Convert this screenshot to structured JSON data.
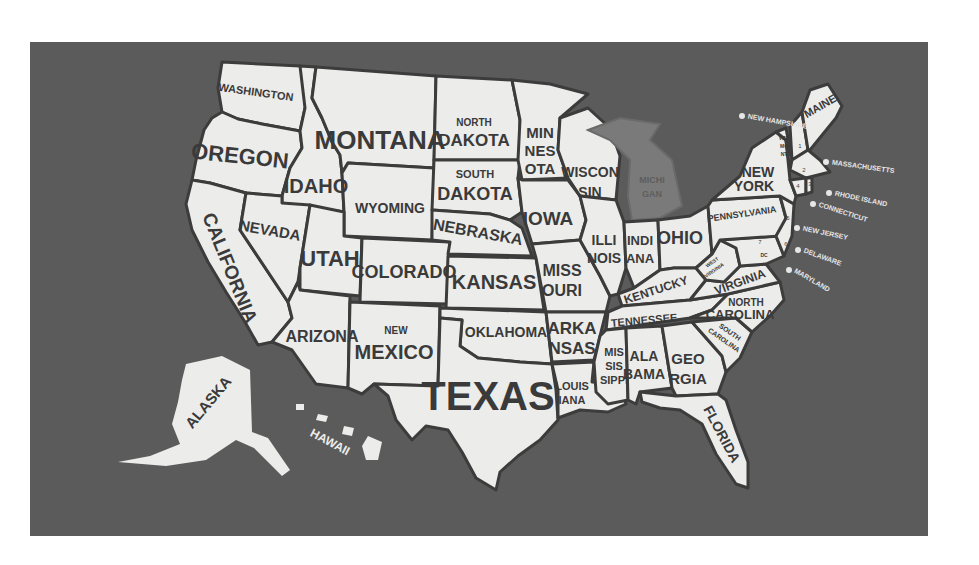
{
  "map": {
    "title": "United States Map with State Names",
    "colors": {
      "background": "#ffffff",
      "board": "#5b5b5b",
      "state_fill": "#ececea",
      "state_border": "#3c3c3c",
      "label_text": "#3a3a3a",
      "michigan_fill": "#7a7a7a",
      "callout_text": "#e6e6e6"
    },
    "states": {
      "washington": "WASHINGTON",
      "oregon": "OREGON",
      "california": "CALIFORNIA",
      "idaho": "IDAHO",
      "nevada": "NEVADA",
      "montana": "MONTANA",
      "wyoming": "WYOMING",
      "utah": "UTAH",
      "arizona": "ARIZONA",
      "colorado": "COLORADO",
      "new_mexico_top": "NEW",
      "new_mexico_bottom": "MEXICO",
      "north_dakota_top": "NORTH",
      "north_dakota_bottom": "DAKOTA",
      "south_dakota_top": "SOUTH",
      "south_dakota_bottom": "DAKOTA",
      "nebraska": "NEBRASKA",
      "kansas": "KANSAS",
      "oklahoma": "OKLAHOMA",
      "texas": "TEXAS",
      "minnesota_1": "MIN",
      "minnesota_2": "NES",
      "minnesota_3": "OTA",
      "iowa": "IOWA",
      "missouri_1": "MISS",
      "missouri_2": "OURI",
      "arkansas_1": "ARKA",
      "arkansas_2": "NSAS",
      "louisiana_1": "LOUIS",
      "louisiana_2": "IANA",
      "wisconsin_1": "WISCON",
      "wisconsin_2": "SIN",
      "illinois_1": "ILLI",
      "illinois_2": "NOIS",
      "michigan_1": "MICHI",
      "michigan_2": "GAN",
      "indiana_1": "INDI",
      "indiana_2": "ANA",
      "ohio": "OHIO",
      "kentucky": "KENTUCKY",
      "tennessee": "TENNESSEE",
      "mississippi_1": "MIS",
      "mississippi_2": "SIS",
      "mississippi_3": "SIPPI",
      "alabama_1": "ALA",
      "alabama_2": "BAMA",
      "georgia_1": "GEO",
      "georgia_2": "RGIA",
      "florida": "FLORIDA",
      "south_carolina_1": "SOUTH",
      "south_carolina_2": "CAROLINA",
      "north_carolina_1": "NORTH",
      "north_carolina_2": "CAROLINA",
      "virginia": "VIRGINIA",
      "west_virginia_1": "WEST",
      "west_virginia_2": "VIRGINIA",
      "pennsylvania": "PENNSYLVANIA",
      "new_york_1": "NEW",
      "new_york_2": "YORK",
      "vermont_1": "VER",
      "vermont_2": "MO",
      "vermont_3": "NT",
      "maine": "MAINE",
      "alaska": "ALASKA",
      "hawaii": "HAWAII",
      "dc": "DC"
    },
    "callouts": [
      {
        "number": "1",
        "label": "NEW HAMPSHIRE"
      },
      {
        "number": "2",
        "label": "MASSACHUSETTS"
      },
      {
        "number": "3",
        "label": "RHODE ISLAND"
      },
      {
        "number": "4",
        "label": "CONNECTICUT"
      },
      {
        "number": "5",
        "label": "NEW JERSEY"
      },
      {
        "number": "6",
        "label": "DELAWARE"
      },
      {
        "number": "7",
        "label": "MARYLAND"
      }
    ]
  }
}
